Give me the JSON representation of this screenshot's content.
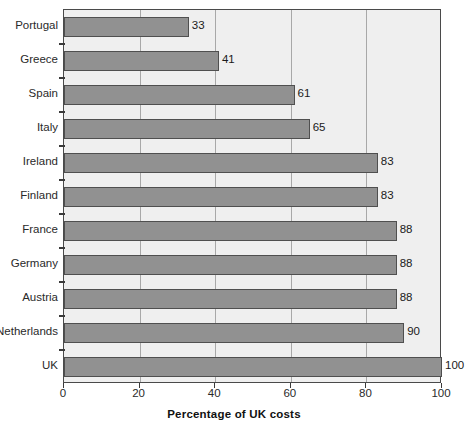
{
  "chart_data": {
    "type": "bar",
    "orientation": "horizontal",
    "title": "",
    "xlabel": "Percentage of UK costs",
    "ylabel": "",
    "xlim": [
      0,
      100
    ],
    "xticks": [
      0,
      20,
      40,
      60,
      80,
      100
    ],
    "xtick_labels": [
      "0",
      "20",
      "40",
      "60",
      "80",
      "100"
    ],
    "grid": true,
    "grid_axis": "x",
    "legend": false,
    "categories": [
      "Portugal",
      "Greece",
      "Spain",
      "Italy",
      "Ireland",
      "Finland",
      "France",
      "Germany",
      "Austria",
      "Netherlands",
      "UK"
    ],
    "values": [
      33,
      41,
      61,
      65,
      83,
      83,
      88,
      88,
      88,
      90,
      100
    ],
    "value_labels": [
      "33",
      "41",
      "61",
      "65",
      "83",
      "83",
      "88",
      "88",
      "88",
      "90",
      "100"
    ],
    "colors": {
      "bar_fill": "#919191",
      "bar_edge": "#4f4f4f",
      "plot_background": "#efefef",
      "gridline": "#a8a8a8",
      "axis": "#4a4a4a",
      "text": "#1a1a1a"
    }
  }
}
